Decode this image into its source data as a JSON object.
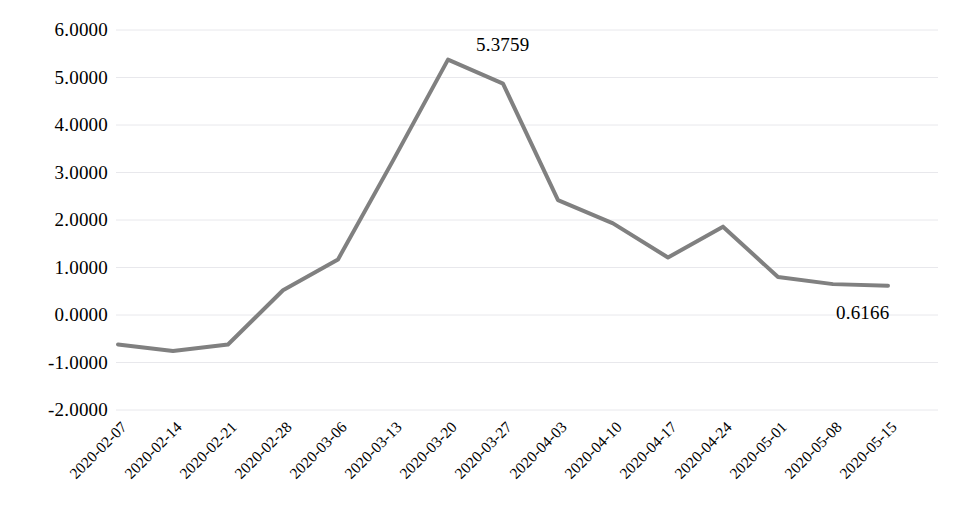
{
  "chart_data": {
    "type": "line",
    "title": "",
    "subtitle": "",
    "xlabel": "",
    "ylabel": "",
    "grid": true,
    "legend": false,
    "legend_position": "none",
    "line_color": "#808080",
    "line_width": 4,
    "marker": "none",
    "ylim": [
      -2.0,
      6.0
    ],
    "ytick_step": 1.0,
    "ytick_format": "0.0000",
    "x_tick_rotation": -45,
    "categories": [
      "2020-02-07",
      "2020-02-14",
      "2020-02-21",
      "2020-02-28",
      "2020-03-06",
      "2020-03-13",
      "2020-03-20",
      "2020-03-27",
      "2020-04-03",
      "2020-04-10",
      "2020-04-17",
      "2020-04-24",
      "2020-05-01",
      "2020-05-08",
      "2020-05-15"
    ],
    "values": [
      -0.62,
      -0.76,
      -0.62,
      0.52,
      1.17,
      3.25,
      5.3759,
      4.87,
      2.42,
      1.93,
      1.21,
      1.86,
      0.8,
      0.65,
      0.6166
    ],
    "ytick_labels": [
      "6.0000",
      "5.0000",
      "4.0000",
      "3.0000",
      "2.0000",
      "1.0000",
      "0.0000",
      "-1.0000",
      "-2.0000"
    ],
    "ytick_values": [
      6,
      5,
      4,
      3,
      2,
      1,
      0,
      -1,
      -2
    ],
    "annotations": [
      {
        "name": "peak-value-label",
        "index": 6,
        "text": "5.3759",
        "value": 5.3759,
        "dx": 28,
        "dy": -26
      },
      {
        "name": "last-value-label",
        "index": 14,
        "text": "0.6166",
        "value": 0.6166,
        "dx": -52,
        "dy": 16
      }
    ]
  }
}
